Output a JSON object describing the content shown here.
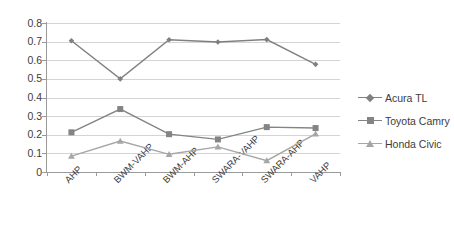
{
  "chart_data": {
    "type": "line",
    "title": "",
    "xlabel": "",
    "ylabel": "",
    "categories": [
      "AHP",
      "BWM-VAHP",
      "BWM-AHP",
      "SWARA-VAHP",
      "SWARA-AHP",
      "VAHP"
    ],
    "ylim": [
      0,
      0.8
    ],
    "ytick_labels": [
      "0.8",
      "0.7",
      "0.6",
      "0.5",
      "0.4",
      "0.3",
      "0.2",
      "0.1",
      "0"
    ],
    "ytick_values": [
      0.8,
      0.7,
      0.6,
      0.5,
      0.4,
      0.3,
      0.2,
      0.1,
      0
    ],
    "grid": true,
    "legend_position": "right",
    "series": [
      {
        "name": "Acura TL",
        "marker": "diamond",
        "color": "#808080",
        "values": [
          0.705,
          0.5,
          0.71,
          0.698,
          0.711,
          0.578
        ]
      },
      {
        "name": "Toyota Camry",
        "marker": "square",
        "color": "#848484",
        "values": [
          0.213,
          0.338,
          0.203,
          0.175,
          0.241,
          0.236
        ]
      },
      {
        "name": "Honda Civic",
        "marker": "triangle",
        "color": "#a6a6a6",
        "values": [
          0.085,
          0.166,
          0.095,
          0.135,
          0.061,
          0.205
        ]
      }
    ]
  },
  "legend": {
    "items": [
      {
        "label": "Acura TL"
      },
      {
        "label": "Toyota Camry"
      },
      {
        "label": "Honda Civic"
      }
    ]
  },
  "axes": {
    "y_labels": [
      "0.8",
      "0.7",
      "0.6",
      "0.5",
      "0.4",
      "0.3",
      "0.2",
      "0.1",
      "0"
    ],
    "x_labels": [
      "AHP",
      "BWM-VAHP",
      "BWM-AHP",
      "SWARA-VAHP",
      "SWARA-AHP",
      "VAHP"
    ]
  },
  "colors": {
    "grid": "#d4d4d4",
    "axis": "#9a9a9a",
    "text": "#3c3c3c",
    "background": "#ffffff"
  }
}
